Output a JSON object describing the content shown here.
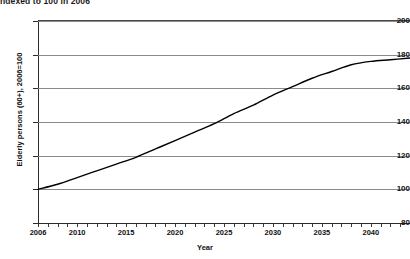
{
  "chart_data": {
    "type": "line",
    "title": "ndexed to 100 in 2006",
    "xlabel": "Year",
    "ylabel": "Elderly persons (60+), 2006=100",
    "xlim": [
      2006,
      2044
    ],
    "ylim": [
      80,
      200
    ],
    "ytick_values": [
      80,
      100,
      120,
      140,
      160,
      180,
      200
    ],
    "ytick_labels": [
      "80",
      "100",
      "120",
      "140",
      "160",
      "180",
      "200"
    ],
    "xtick_values": [
      2006,
      2010,
      2015,
      2020,
      2025,
      2030,
      2035,
      2040
    ],
    "xtick_labels": [
      "2006",
      "2010",
      "2015",
      "2020",
      "2025",
      "2030",
      "2035",
      "2040"
    ],
    "grid": "horizontal",
    "legend": "none",
    "series": [
      {
        "name": "Elderly persons (60+) index",
        "color": "#000000",
        "x": [
          2006,
          2008,
          2010,
          2012,
          2014,
          2016,
          2018,
          2020,
          2022,
          2024,
          2026,
          2028,
          2030,
          2032,
          2034,
          2036,
          2038,
          2040,
          2042,
          2044
        ],
        "values": [
          100,
          103,
          107,
          111,
          115,
          119,
          124,
          129,
          134,
          139,
          145,
          150,
          156,
          161,
          166,
          170,
          174,
          176,
          177,
          178
        ]
      }
    ]
  },
  "axes": {
    "y_title": "Elderly persons (60+), 2006=100",
    "x_title": "Year"
  }
}
